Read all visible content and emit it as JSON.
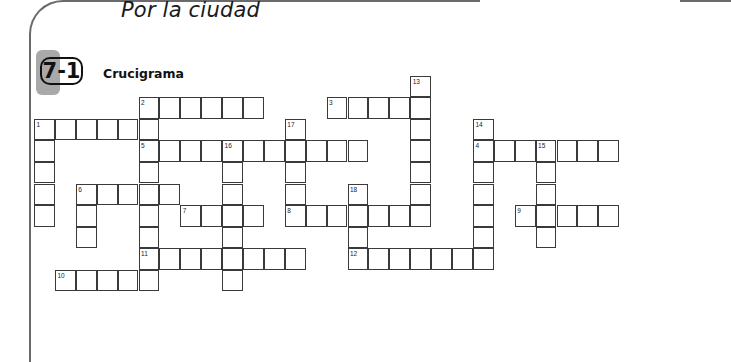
{
  "chapter_title": "Por la ciudad",
  "section": {
    "number": "7-1",
    "title": "Crucigrama"
  },
  "crossword": {
    "words": [
      {
        "number": "1",
        "direction": "across",
        "row": 2,
        "col": 0,
        "length": 6
      },
      {
        "number": "1",
        "direction": "down",
        "row": 2,
        "col": 0,
        "length": 5
      },
      {
        "number": "2",
        "direction": "across",
        "row": 1,
        "col": 5,
        "length": 6
      },
      {
        "number": "2",
        "direction": "down",
        "row": 1,
        "col": 5,
        "length": 9
      },
      {
        "number": "3",
        "direction": "across",
        "row": 1,
        "col": 14,
        "length": 5
      },
      {
        "number": "4",
        "direction": "across",
        "row": 3,
        "col": 21,
        "length": 7
      },
      {
        "number": "5",
        "direction": "across",
        "row": 3,
        "col": 5,
        "length": 11
      },
      {
        "number": "6",
        "direction": "across",
        "row": 5,
        "col": 2,
        "length": 5
      },
      {
        "number": "6",
        "direction": "down",
        "row": 5,
        "col": 2,
        "length": 3
      },
      {
        "number": "7",
        "direction": "across",
        "row": 6,
        "col": 7,
        "length": 4
      },
      {
        "number": "8",
        "direction": "across",
        "row": 6,
        "col": 12,
        "length": 7
      },
      {
        "number": "9",
        "direction": "across",
        "row": 6,
        "col": 23,
        "length": 5
      },
      {
        "number": "10",
        "direction": "across",
        "row": 9,
        "col": 1,
        "length": 5
      },
      {
        "number": "11",
        "direction": "across",
        "row": 8,
        "col": 5,
        "length": 8
      },
      {
        "number": "12",
        "direction": "across",
        "row": 8,
        "col": 15,
        "length": 7
      },
      {
        "number": "13",
        "direction": "down",
        "row": 0,
        "col": 18,
        "length": 7
      },
      {
        "number": "14",
        "direction": "down",
        "row": 2,
        "col": 21,
        "length": 7
      },
      {
        "number": "15",
        "direction": "down",
        "row": 3,
        "col": 24,
        "length": 5
      },
      {
        "number": "16",
        "direction": "down",
        "row": 3,
        "col": 9,
        "length": 7
      },
      {
        "number": "17",
        "direction": "down",
        "row": 2,
        "col": 12,
        "length": 5
      },
      {
        "number": "18",
        "direction": "down",
        "row": 5,
        "col": 15,
        "length": 4
      }
    ]
  }
}
